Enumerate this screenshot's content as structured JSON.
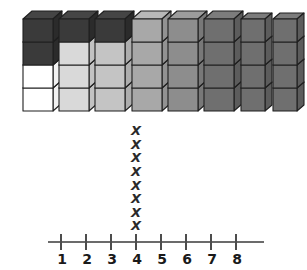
{
  "figure": {
    "title": ""
  },
  "towers": {
    "label": "cube-towers",
    "count": 8,
    "items": [
      {
        "index": 1,
        "cubes": 4,
        "x": 22,
        "width": 30,
        "cube_height": 23,
        "fills": [
          "dark",
          "dark",
          "white",
          "white"
        ]
      },
      {
        "index": 2,
        "cubes": 4,
        "x": 58,
        "width": 30,
        "cube_height": 23,
        "fills": [
          "dark",
          "light",
          "light",
          "light"
        ]
      },
      {
        "index": 3,
        "cubes": 4,
        "x": 94,
        "width": 30,
        "cube_height": 23,
        "fills": [
          "dark",
          "medlight",
          "medlight",
          "medlight"
        ]
      },
      {
        "index": 4,
        "cubes": 4,
        "x": 131,
        "width": 30,
        "cube_height": 23,
        "fills": [
          "medium",
          "medium",
          "medium",
          "medium"
        ]
      },
      {
        "index": 5,
        "cubes": 4,
        "x": 167,
        "width": 30,
        "cube_height": 23,
        "fills": [
          "meddark",
          "meddark",
          "meddark",
          "meddark"
        ]
      },
      {
        "index": 6,
        "cubes": 4,
        "x": 203,
        "width": 30,
        "cube_height": 23,
        "fills": [
          "dark2",
          "dark2",
          "dark2",
          "dark2"
        ]
      },
      {
        "index": 7,
        "cubes": 4,
        "x": 240,
        "width": 24,
        "cube_height": 23,
        "fills": [
          "dark2",
          "dark2",
          "dark2",
          "dark2"
        ]
      },
      {
        "index": 8,
        "cubes": 4,
        "x": 272,
        "width": 24,
        "cube_height": 23,
        "fills": [
          "dark2",
          "dark2",
          "dark2",
          "dark2"
        ]
      }
    ]
  },
  "colors": {
    "white_front": "#ffffff",
    "white_side": "#f2f2f2",
    "white_top": "#ffffff",
    "light_front": "#d9d9d9",
    "light_side": "#c2c2c2",
    "light_top": "#e8e8e8",
    "medlight_front": "#c4c4c4",
    "medlight_side": "#adadad",
    "medlight_top": "#d4d4d4",
    "medium_front": "#a8a8a8",
    "medium_side": "#929292",
    "medium_top": "#b8b8b8",
    "meddark_front": "#8d8d8d",
    "meddark_side": "#787878",
    "meddark_top": "#9c9c9c",
    "dark2_front": "#6f6f6f",
    "dark2_side": "#5c5c5c",
    "dark2_top": "#7c7c7c",
    "dark_front": "#3a3a3a",
    "dark_side": "#2b2b2b",
    "dark_top": "#454545",
    "outline": "#1f1f1f",
    "axis": "#6b6b6b",
    "tick": "#4d4d4d",
    "text": "#1a1a1a",
    "x_mark": "#2a2a2a"
  },
  "chart_data": {
    "type": "scatter",
    "plot_style": "dot-plot",
    "title": "",
    "xlabel": "",
    "ylabel": "",
    "mark_glyph": "X",
    "categories": [
      "1",
      "2",
      "3",
      "4",
      "5",
      "6",
      "7",
      "8"
    ],
    "x": [
      1,
      2,
      3,
      4,
      5,
      6,
      7,
      8
    ],
    "values": [
      0,
      0,
      0,
      8,
      0,
      0,
      0,
      0
    ],
    "xlim": [
      1,
      8
    ],
    "tick_labels": [
      "1",
      "2",
      "3",
      "4",
      "5",
      "6",
      "7",
      "8"
    ],
    "grid": false,
    "legend": false,
    "annotations": [
      {
        "at": 4,
        "count": 8,
        "note": "eight X marks stacked above 4"
      }
    ]
  },
  "numberline": {
    "label": "number-line",
    "ticks": [
      {
        "value": 1,
        "label": "1",
        "x": 60
      },
      {
        "value": 2,
        "label": "2",
        "x": 85
      },
      {
        "value": 3,
        "label": "3",
        "x": 110
      },
      {
        "value": 4,
        "label": "4",
        "x": 135
      },
      {
        "value": 5,
        "label": "5",
        "x": 160
      },
      {
        "value": 6,
        "label": "6",
        "x": 185
      },
      {
        "value": 7,
        "label": "7",
        "x": 210
      },
      {
        "value": 8,
        "label": "8",
        "x": 235
      }
    ]
  },
  "xmarks": {
    "label": "x-marks-column",
    "at_value": 4,
    "x_center": 136,
    "count": 8,
    "marks": [
      "X",
      "X",
      "X",
      "X",
      "X",
      "X",
      "X",
      "X"
    ]
  }
}
